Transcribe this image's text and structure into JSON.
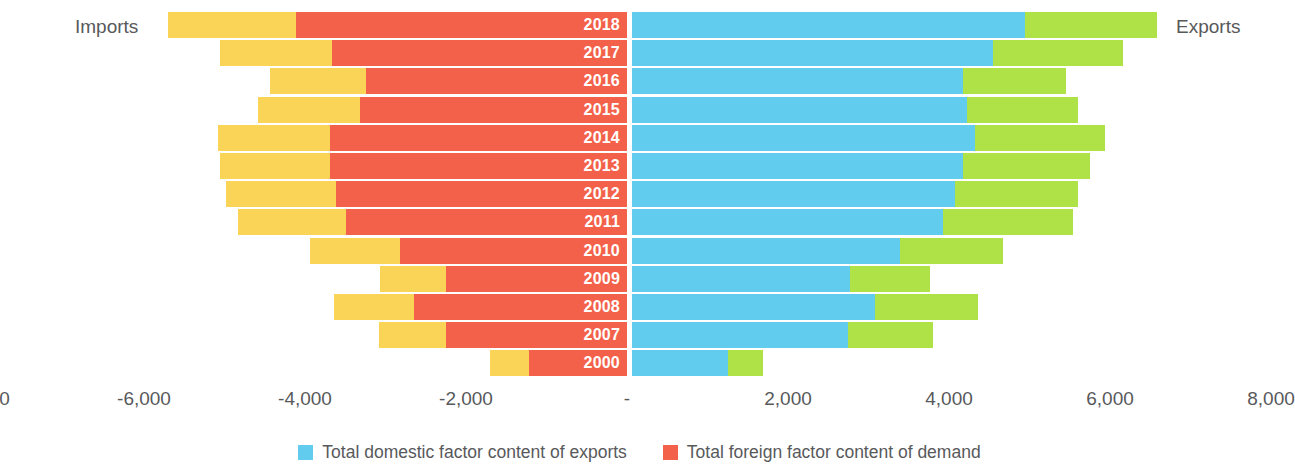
{
  "chart_data": {
    "type": "bar",
    "subtype": "diverging-stacked-horizontal",
    "title": "",
    "xlabel": "",
    "ylabel": "",
    "left_caption": "Imports",
    "right_caption": "Exports",
    "categories": [
      "2018",
      "2017",
      "2016",
      "2015",
      "2014",
      "2013",
      "2012",
      "2011",
      "2010",
      "2009",
      "2008",
      "2007",
      "2000"
    ],
    "xlim": [
      -8000,
      8000
    ],
    "xticks": [
      -8000,
      -6000,
      -4000,
      -2000,
      0,
      2000,
      4000,
      6000,
      8000
    ],
    "xticklabels": [
      "-8,000",
      "-6,000",
      "-4,000",
      "-2,000",
      "-",
      "2,000",
      "4,000",
      "6,000",
      "8,000"
    ],
    "grid": false,
    "legend_position": "bottom-center",
    "zero_px": 627,
    "px_per_unit": 0.0805,
    "series": [
      {
        "name": "Total foreign factor content of demand",
        "key": "foreign_demand",
        "color": "#F4614A",
        "side": "imports",
        "values": [
          -4110,
          -3665,
          -3245,
          -3315,
          -3690,
          -3690,
          -3615,
          -3490,
          -2820,
          -2250,
          -2650,
          -2250,
          -1215
        ]
      },
      {
        "name": "Domestic factor content of imports",
        "key": "domestic_imports",
        "color": "#F9D457",
        "side": "imports",
        "values": [
          -1590,
          -1390,
          -1195,
          -1265,
          -1390,
          -1365,
          -1370,
          -1345,
          -1120,
          -820,
          -995,
          -830,
          -490
        ]
      },
      {
        "name": "Total domestic factor content of exports",
        "key": "domestic_exports",
        "color": "#62CCEE",
        "side": "exports",
        "values": [
          4945,
          4545,
          4175,
          4225,
          4325,
          4175,
          4075,
          3925,
          3390,
          2770,
          3080,
          2745,
          1255
        ]
      },
      {
        "name": "Foreign factor content of exports",
        "key": "foreign_exports",
        "color": "#AEE246",
        "side": "exports",
        "values": [
          1640,
          1615,
          1280,
          1380,
          1615,
          1580,
          1530,
          1615,
          1280,
          995,
          1280,
          1055,
          435
        ]
      }
    ],
    "legend_entries": [
      {
        "label": "Total domestic factor content of exports",
        "color": "#62CCEE",
        "icon": "legend-swatch"
      },
      {
        "label": "Total foreign factor content of demand",
        "color": "#F4614A",
        "icon": "legend-swatch"
      }
    ],
    "colors": {
      "yellow": "#F9D457",
      "orange": "#F4614A",
      "blue": "#62CCEE",
      "green": "#AEE246",
      "text": "#58595b",
      "background": "#FFFFFF"
    }
  }
}
